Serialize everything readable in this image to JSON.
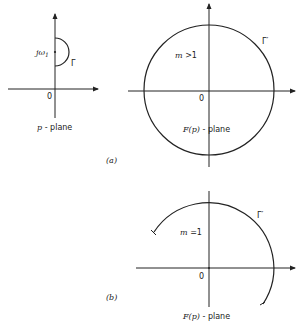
{
  "figure": {
    "panels": [
      {
        "id": "p-plane",
        "origin_label": "0",
        "point_label_main": "jω",
        "point_label_sub": "1",
        "contour_label": "Γ",
        "plane_label_var": "p",
        "plane_label_rest": " - plane"
      },
      {
        "id": "a",
        "panel_tag": "(a)",
        "origin_label": "0",
        "condition_var": "m",
        "condition_rest": " >1",
        "contour_label": "Γ′",
        "plane_label_var": "F(p)",
        "plane_label_rest": " - plane"
      },
      {
        "id": "b",
        "panel_tag": "(b)",
        "origin_label": "0",
        "condition_var": "m",
        "condition_rest": " =1",
        "contour_label": "Γ′",
        "plane_label_var": "F(p)",
        "plane_label_rest": " - plane"
      }
    ]
  }
}
